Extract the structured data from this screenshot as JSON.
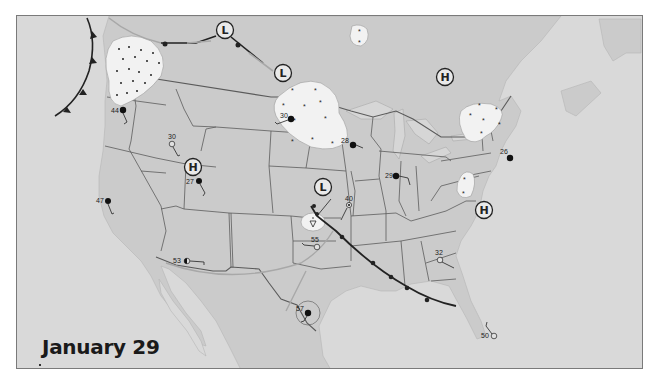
{
  "map": {
    "date_label": "January 29",
    "colors": {
      "ocean": "#d9d9d9",
      "land": "#c9c9c9",
      "us_land": "#c4c4c4",
      "state_border": "#555555",
      "precip_fill": "#f2f2f2",
      "front_cold": "#222222",
      "front_stationary_gray": "#a8a8a8",
      "station_filled": "#111111"
    },
    "pressure_centers": [
      {
        "type": "L",
        "x": 224,
        "y": 15,
        "label": "L"
      },
      {
        "type": "L",
        "x": 268,
        "y": 57,
        "label": "L"
      },
      {
        "type": "H",
        "x": 428,
        "y": 61,
        "label": "H"
      },
      {
        "type": "H",
        "x": 176,
        "y": 151,
        "label": "H"
      },
      {
        "type": "L",
        "x": 306,
        "y": 197,
        "label": "L"
      },
      {
        "type": "H",
        "x": 469,
        "y": 194,
        "label": "H"
      }
    ],
    "stations": [
      {
        "temp": "44",
        "x": 106,
        "y": 94,
        "cover": "overcast",
        "label_dx": -10,
        "label_dy": 2
      },
      {
        "temp": "30",
        "x": 155,
        "y": 128,
        "cover": "clear",
        "label_dx": -4,
        "label_dy": -7
      },
      {
        "temp": "27",
        "x": 183,
        "y": 163,
        "cover": "overcast",
        "label_dx": -12,
        "label_dy": 2
      },
      {
        "temp": "47",
        "x": 91,
        "y": 186,
        "cover": "three_quarter",
        "label_dx": -12,
        "label_dy": 0
      },
      {
        "temp": "53",
        "x": 170,
        "y": 246,
        "cover": "half",
        "label_dx": -13,
        "label_dy": 2
      },
      {
        "temp": "55",
        "x": 301,
        "y": 231,
        "cover": "clear",
        "label_dx": -11,
        "label_dy": -6
      },
      {
        "temp": "57",
        "x": 292,
        "y": 297,
        "cover": "overcast",
        "label_dx": -12,
        "label_dy": -3
      },
      {
        "temp": "30",
        "x": 273,
        "y": 104,
        "cover": "overcast",
        "label_dx": -11,
        "label_dy": -3
      },
      {
        "temp": "28",
        "x": 336,
        "y": 129,
        "cover": "overcast",
        "label_dx": -12,
        "label_dy": -3
      },
      {
        "temp": "29",
        "x": 379,
        "y": 160,
        "cover": "overcast",
        "label_dx": -11,
        "label_dy": 2
      },
      {
        "temp": "40",
        "x": 332,
        "y": 188,
        "cover": "clear",
        "label_dx": -3,
        "label_dy": -6
      },
      {
        "temp": "26",
        "x": 493,
        "y": 142,
        "cover": "overcast",
        "label_dx": -8,
        "label_dy": -6
      },
      {
        "temp": "32",
        "x": 424,
        "y": 244,
        "cover": "clear",
        "label_dx": -4,
        "label_dy": -7
      },
      {
        "temp": "50",
        "x": 480,
        "y": 330,
        "cover": "clear",
        "label_dx": -12,
        "label_dy": 2
      }
    ],
    "precip_areas": [
      {
        "kind": "rain",
        "name": "pacific-northwest-rain"
      },
      {
        "kind": "snow",
        "name": "northern-plains-snow"
      },
      {
        "kind": "snow",
        "name": "northeast-snow"
      },
      {
        "kind": "snow",
        "name": "appalachian-snow"
      },
      {
        "kind": "snow",
        "name": "canada-snow"
      },
      {
        "kind": "showers",
        "name": "kansas-showers"
      }
    ]
  }
}
